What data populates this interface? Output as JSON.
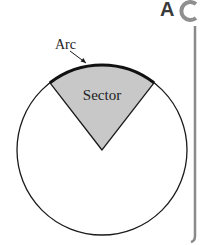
{
  "diagram": {
    "labels": {
      "arc": "Arc",
      "sector": "Sector"
    },
    "corner_logo": {
      "text_a": "A",
      "text_c": "C",
      "icon": "ac-logo-icon"
    },
    "colors": {
      "sector_fill": "#c8c8c8",
      "stroke": "#1a1a1a",
      "side_bar": "#8a8a8a",
      "logo_a": "#3a3a3a",
      "logo_c": "#8f8f8f"
    }
  }
}
